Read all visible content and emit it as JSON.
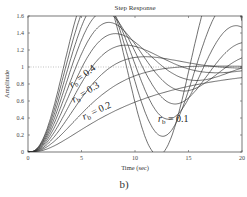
{
  "chart_data": {
    "type": "line",
    "title": "Step Response",
    "xlabel": "Time (sec)",
    "ylabel": "Amplitude",
    "caption": "b)",
    "xlim": [
      0,
      20
    ],
    "ylim": [
      0,
      1.6
    ],
    "xticks": [
      0,
      5,
      10,
      15,
      20
    ],
    "yticks": [
      0,
      0.2,
      0.4,
      0.6,
      0.8,
      1,
      1.2,
      1.4,
      1.6
    ],
    "reference_line": {
      "y": 1,
      "style": "dotted"
    },
    "grid": false,
    "annotations": [
      {
        "text": "r_b = 0.4",
        "rb": 0.4
      },
      {
        "text": "r_b = 0.3",
        "rb": 0.3
      },
      {
        "text": "r_b = 0.2",
        "rb": 0.2
      },
      {
        "text": "r_b = 0.1",
        "rb": 0.1
      }
    ],
    "sample_t": [
      0,
      2.5,
      5,
      7.5,
      10,
      12.5,
      15,
      17.5,
      20
    ],
    "series": [
      {
        "name": "r_b = 0.1",
        "rb": 0.1,
        "values": [
          0,
          0.05,
          0.2,
          0.3,
          0.38,
          0.45,
          0.5,
          0.55,
          0.6
        ]
      },
      {
        "name": "r_b = 0.2",
        "rb": 0.2,
        "values": [
          0,
          0.08,
          0.38,
          0.55,
          0.65,
          0.72,
          0.78,
          0.82,
          0.85
        ]
      },
      {
        "name": "r_b = 0.3",
        "rb": 0.3,
        "values": [
          0,
          0.12,
          0.6,
          0.78,
          0.8,
          0.82,
          0.87,
          0.9,
          0.92
        ]
      },
      {
        "name": "r_b = 0.4",
        "rb": 0.4,
        "values": [
          0,
          0.18,
          0.8,
          0.93,
          0.86,
          0.82,
          0.92,
          0.97,
          0.95
        ]
      },
      {
        "name": "r_b = 1.0",
        "rb": 1.0,
        "values": [
          0,
          0.25,
          1.35,
          1.52,
          0.75,
          0.55,
          1.35,
          1.35,
          0.9
        ]
      }
    ],
    "model": {
      "rb_values": [
        0.1,
        0.2,
        0.3,
        0.4,
        0.5,
        0.6,
        0.7,
        0.8,
        0.9,
        1.0
      ],
      "delay": 1.2,
      "wn": 0.52
    }
  }
}
